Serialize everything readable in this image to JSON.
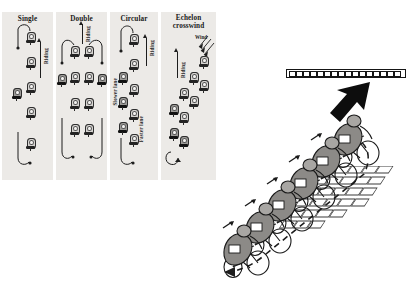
{
  "figure": {
    "title_visible": false,
    "panels": [
      {
        "id": "single",
        "title": "Single",
        "direction_label": "Riding",
        "rider_count_main": 5,
        "rider_count_returning": 1,
        "description": "single paceline rotation"
      },
      {
        "id": "double",
        "title": "Double",
        "direction_label": "Riding",
        "rider_count_main": 8,
        "rider_count_returning": 2,
        "description": "double paceline rotation"
      },
      {
        "id": "circular",
        "title": "Circular",
        "direction_label": "Riding",
        "lane_label_left": "Slower lane",
        "lane_label_right": "Faster lane",
        "rider_count_main": 9,
        "description": "circular rotation with faster and slower lanes"
      },
      {
        "id": "echelon",
        "title": "Echelon",
        "title_line2": "crosswind",
        "direction_label": "Riding",
        "wind_label": "Wind",
        "rider_count_main": 9,
        "description": "diagonal echelon formation in crosswind"
      }
    ]
  },
  "scene": {
    "name": "echelon-crosswind-perspective",
    "rider_count": 6,
    "barrier_segments": 17,
    "wind_arrow": "thick-black-arrow-down-left",
    "rotation_path": "dashed-loop-counterclockwise",
    "road_texture": "brick-paving-rows",
    "road_rows": 6,
    "road_bricks_per_row": 5
  },
  "colors": {
    "panel_background": "#eceae7",
    "rider_fill": "#8c8a87",
    "rider_outline": "#1a1a1a",
    "line": "#1d1d1d",
    "page_background": "#ffffff"
  }
}
